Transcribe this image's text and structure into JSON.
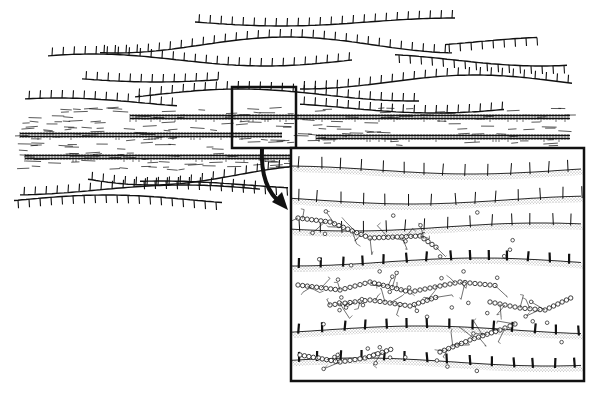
{
  "figure": {
    "width": 598,
    "height": 396,
    "background": "#ffffff",
    "ink": "#111111",
    "overview": {
      "region": {
        "x": 10,
        "y": 15,
        "w": 590,
        "h": 190
      },
      "barbed_strands": [
        {
          "id": "s1",
          "y": 22,
          "x0": 195,
          "x1": 455,
          "amp": 4,
          "ticks": "up"
        },
        {
          "id": "s2",
          "y": 45,
          "x0": 100,
          "x1": 455,
          "amp": 8,
          "ticks": "up"
        },
        {
          "id": "s3",
          "y": 42,
          "x0": 445,
          "x1": 540,
          "amp": 5,
          "ticks": "down"
        },
        {
          "id": "s4",
          "y": 60,
          "x0": 48,
          "x1": 355,
          "amp": 6,
          "ticks": "up"
        },
        {
          "id": "s5",
          "y": 60,
          "x0": 395,
          "x1": 570,
          "amp": 6,
          "ticks": "down"
        },
        {
          "id": "s6",
          "y": 78,
          "x0": 82,
          "x1": 220,
          "amp": 4,
          "ticks": "up"
        },
        {
          "id": "s7",
          "y": 82,
          "x0": 300,
          "x1": 572,
          "amp": 7,
          "ticks": "up"
        },
        {
          "id": "s8",
          "y": 95,
          "x0": 135,
          "x1": 420,
          "amp": 6,
          "ticks": "up"
        },
        {
          "id": "s9",
          "y": 103,
          "x0": 25,
          "x1": 180,
          "amp": 5,
          "ticks": "up"
        },
        {
          "id": "s10",
          "y": 108,
          "x0": 300,
          "x1": 505,
          "amp": 5,
          "ticks": "up"
        },
        {
          "id": "s11",
          "y": 175,
          "x0": 88,
          "x1": 300,
          "amp": 10,
          "ticks": "up"
        },
        {
          "id": "s12",
          "y": 190,
          "x0": 20,
          "x1": 260,
          "amp": 5,
          "ticks": "up"
        },
        {
          "id": "s13",
          "y": 200,
          "x0": 14,
          "x1": 225,
          "amp": 5,
          "ticks": "down"
        },
        {
          "id": "s14",
          "y": 185,
          "x0": 140,
          "x1": 290,
          "amp": 4,
          "ticks": "down"
        }
      ],
      "hatched_strands": [
        {
          "id": "h1",
          "y": 117,
          "x0": 130,
          "x1": 570
        },
        {
          "id": "h2",
          "y": 135,
          "x0": 20,
          "x1": 282
        },
        {
          "id": "h3",
          "y": 137,
          "x0": 316,
          "x1": 570
        },
        {
          "id": "h4",
          "y": 157,
          "x0": 25,
          "x1": 290
        }
      ],
      "dashed_matrix_band": {
        "y0": 108,
        "y1": 170,
        "x0": 15,
        "x1": 590
      }
    },
    "selection_box": {
      "x": 232,
      "y": 87,
      "w": 64,
      "h": 61,
      "stroke": 2.5
    },
    "arrow": {
      "from": [
        262,
        148
      ],
      "to": [
        288,
        210
      ],
      "stroke": 4
    },
    "inset": {
      "x": 291,
      "y": 148,
      "w": 293,
      "h": 233,
      "stroke": 2.5,
      "bands": [
        {
          "id": "b1",
          "y": 170,
          "stipple": true
        },
        {
          "id": "b2",
          "y": 200,
          "stipple": true
        },
        {
          "id": "b3",
          "y": 227,
          "stipple": true
        },
        {
          "id": "b4",
          "y": 262,
          "stipple": true
        },
        {
          "id": "b5",
          "y": 330,
          "stipple": true
        },
        {
          "id": "b6",
          "y": 362,
          "stipple": true
        }
      ],
      "bead_chains": [
        {
          "id": "c1",
          "points": [
            [
              298,
              218
            ],
            [
              330,
              222
            ],
            [
              370,
              238
            ],
            [
              420,
              236
            ],
            [
              440,
              250
            ]
          ]
        },
        {
          "id": "c2",
          "points": [
            [
              298,
              285
            ],
            [
              340,
              290
            ],
            [
              370,
              282
            ],
            [
              410,
              292
            ],
            [
              430,
              288
            ],
            [
              460,
              282
            ],
            [
              500,
              286
            ]
          ]
        },
        {
          "id": "c3",
          "points": [
            [
              330,
              305
            ],
            [
              370,
              300
            ],
            [
              410,
              306
            ],
            [
              440,
              296
            ]
          ]
        },
        {
          "id": "c4",
          "points": [
            [
              490,
              302
            ],
            [
              520,
              308
            ],
            [
              545,
              310
            ],
            [
              575,
              296
            ]
          ]
        },
        {
          "id": "c5",
          "points": [
            [
              300,
              355
            ],
            [
              340,
              362
            ],
            [
              365,
              358
            ],
            [
              395,
              348
            ]
          ]
        },
        {
          "id": "c6",
          "points": [
            [
              440,
              352
            ],
            [
              470,
              340
            ],
            [
              500,
              330
            ],
            [
              520,
              322
            ]
          ]
        }
      ]
    }
  }
}
